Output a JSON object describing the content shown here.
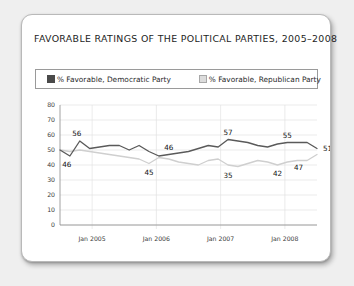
{
  "chart_data": {
    "type": "line",
    "title": "FAVORABLE RATINGS OF THE POLITICAL PARTIES, 2005–2008",
    "xlabel": "",
    "ylabel": "",
    "ylim": [
      0,
      80
    ],
    "yticks": [
      0,
      10,
      20,
      30,
      40,
      50,
      60,
      70,
      80
    ],
    "xtick_labels": [
      "Jan 2005",
      "Jan 2006",
      "Jan 2007",
      "Jan 2008"
    ],
    "grid": true,
    "legend_position": "top",
    "legend": [
      "% Favorable, Democratic Party",
      "% Favorable, Republican Party"
    ],
    "colors": {
      "democratic": "#5a5a5a",
      "republican": "#cfcfcf",
      "grid": "#e3e3e3",
      "axis": "#8c8c8c",
      "card": "#ffffff",
      "background": "#efefef"
    },
    "series": [
      {
        "name": "% Favorable, Democratic Party",
        "color": "#5a5a5a",
        "x": [
          0,
          1,
          2,
          3,
          4,
          5,
          6,
          7,
          8,
          9,
          10,
          11,
          12,
          13,
          14,
          15,
          16,
          17,
          18,
          19,
          20,
          21,
          22,
          23,
          24,
          25,
          26
        ],
        "values": [
          50,
          46,
          56,
          51,
          52,
          53,
          53,
          50,
          53,
          49,
          46,
          47,
          48,
          49,
          51,
          53,
          52,
          57,
          56,
          55,
          53,
          52,
          54,
          55,
          55,
          55,
          51
        ]
      },
      {
        "name": "% Favorable, Republican Party",
        "color": "#cfcfcf",
        "x": [
          0,
          1,
          2,
          3,
          4,
          5,
          6,
          7,
          8,
          9,
          10,
          11,
          12,
          13,
          14,
          15,
          16,
          17,
          18,
          19,
          20,
          21,
          22,
          23,
          24,
          25,
          26
        ],
        "values": [
          50,
          49,
          50,
          49,
          48,
          47,
          46,
          45,
          44,
          41,
          45,
          44,
          42,
          41,
          40,
          43,
          44,
          40,
          39,
          41,
          43,
          42,
          40,
          42,
          43,
          43,
          47
        ]
      }
    ],
    "annotations": [
      {
        "text": "56",
        "x": 2,
        "y": 56,
        "position": "above-left"
      },
      {
        "text": "46",
        "x": 1,
        "y": 46,
        "position": "below-left"
      },
      {
        "text": "46",
        "x": 11,
        "y": 47,
        "position": "above"
      },
      {
        "text": "45",
        "x": 9,
        "y": 41,
        "position": "below"
      },
      {
        "text": "57",
        "x": 17,
        "y": 57,
        "position": "above"
      },
      {
        "text": "35",
        "x": 17,
        "y": 39,
        "position": "below"
      },
      {
        "text": "55",
        "x": 23,
        "y": 55,
        "position": "above"
      },
      {
        "text": "42",
        "x": 22,
        "y": 40,
        "position": "below"
      },
      {
        "text": "51",
        "x": 26,
        "y": 51,
        "position": "right"
      },
      {
        "text": "47",
        "x": 25,
        "y": 43,
        "position": "left-below"
      }
    ]
  }
}
